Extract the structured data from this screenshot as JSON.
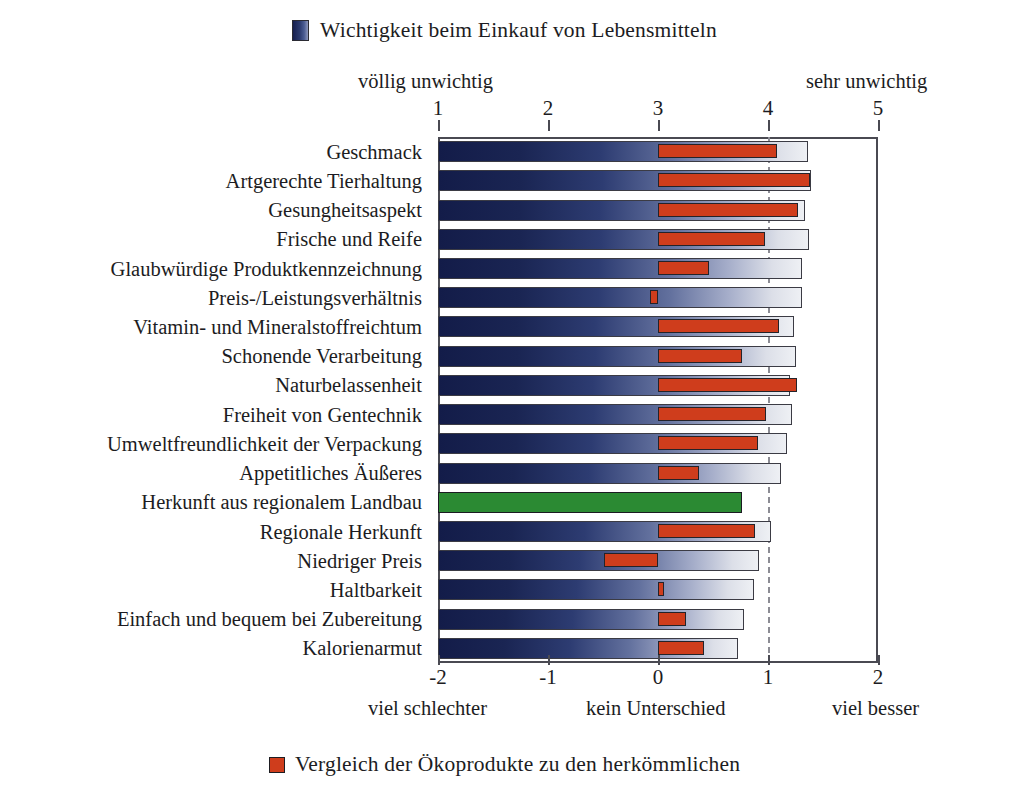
{
  "legend_top": {
    "label": "Wichtigkeit beim Einkauf von Lebensmitteln",
    "swatch_icon": "blue-gradient-swatch-icon",
    "color": "#1a2553"
  },
  "legend_bottom": {
    "label": "Vergleich der Ökoprodukte zu den herkömmlichen",
    "swatch_icon": "red-square-swatch-icon",
    "color": "#cf3d1c"
  },
  "captions": {
    "top_left": "völlig unwichtig",
    "top_right": "sehr unwichtig",
    "bottom_left": "viel schlechter",
    "bottom_center": "kein Unterschied",
    "bottom_right": "viel besser"
  },
  "axes": {
    "top_ticks": [
      "1",
      "2",
      "3",
      "4",
      "5"
    ],
    "bottom_ticks": [
      "-2",
      "-1",
      "0",
      "1",
      "2"
    ],
    "top_range": [
      1,
      5
    ],
    "bottom_range": [
      -2,
      2
    ],
    "reference_line_value": 1
  },
  "chart_data": {
    "type": "bar",
    "orientation": "horizontal",
    "title": "Wichtigkeit beim Einkauf von Lebensmitteln",
    "xlabel": "",
    "ylabel": "",
    "grid": false,
    "legend_position": "top-center and bottom-center",
    "dual_axis": true,
    "xlim_top": [
      1,
      5
    ],
    "xlim_bottom": [
      -2,
      2
    ],
    "axis_top_label_left": "völlig unwichtig",
    "axis_top_label_right": "sehr unwichtig",
    "axis_bottom_label_left": "viel schlechter",
    "axis_bottom_label_center": "kein Unterschied",
    "axis_bottom_label_right": "viel besser",
    "categories": [
      "Geschmack",
      "Artgerechte Tierhaltung",
      "Gesungheitsaspekt",
      "Frische und Reife",
      "Glaubwürdige Produktkennzeichnung",
      "Preis-/Leistungsverhältnis",
      "Vitamin- und Mineralstoffreichtum",
      "Schonende Verarbeitung",
      "Naturbelassenheit",
      "Freiheit von Gentechnik",
      "Umweltfreundlichkeit der Verpackung",
      "Appetitliches Äußeres",
      "Herkunft aus regionalem Landbau",
      "Regionale Herkunft",
      "Niedriger Preis",
      "Haltbarkeit",
      "Einfach und bequem bei Zubereitung",
      "Kalorienarmut"
    ],
    "series": [
      {
        "name": "Wichtigkeit beim Einkauf von Lebensmitteln",
        "scale": "top",
        "color": "#1a2553",
        "baseline": 1,
        "values": [
          4.36,
          4.39,
          4.34,
          4.37,
          4.31,
          4.31,
          4.24,
          4.25,
          4.2,
          4.22,
          4.17,
          4.12,
          3.76,
          4.03,
          3.92,
          3.87,
          3.78,
          3.73
        ],
        "highlight_index": 12,
        "highlight_color": "#2b8a33"
      },
      {
        "name": "Vergleich der Ökoprodukte zu den herkömmlichen",
        "scale": "bottom",
        "color": "#cf3d1c",
        "baseline": 0,
        "values": [
          1.08,
          1.38,
          1.27,
          0.97,
          0.46,
          -0.07,
          1.1,
          0.76,
          1.26,
          0.98,
          0.91,
          0.37,
          null,
          0.88,
          -0.49,
          0.05,
          0.25,
          0.42
        ]
      }
    ]
  }
}
